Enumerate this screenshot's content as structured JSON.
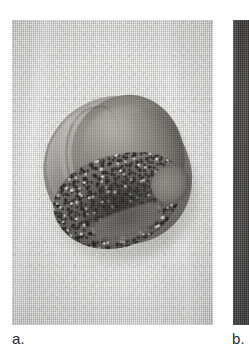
{
  "figure": {
    "type": "clinical-photograph-figure",
    "orientation": "two-panel-horizontal",
    "color_mode": "grayscale",
    "background_color": "#ffffff"
  },
  "panels": [
    {
      "id": "a",
      "caption": "a.",
      "kind": "photograph",
      "fully_visible": true,
      "subject": "amputated digit tip specimen with nail plate and dark crusted ulcerated lesion at the nail base",
      "background_surface": "light woven cloth drape",
      "colors": {
        "cloth_light": "#e9e8e4",
        "cloth_mid": "#d6d5d1",
        "cloth_dark": "#cbcac6",
        "specimen_light": "#b6b2ab",
        "specimen_mid": "#908c85",
        "specimen_dark": "#7c7872",
        "nail_plate": "#8d8880",
        "lesion_dark": "#474440",
        "lesion_core": "#262422",
        "crust_fleck": "#f0eee9"
      }
    },
    {
      "id": "b",
      "caption": "b.",
      "kind": "photograph",
      "fully_visible": false,
      "crop_note": "only the narrow left edge of the second photograph is visible at the right margin",
      "subject": "dark vertical strip of an adjacent photograph",
      "colors": {
        "strip_light": "#6d6a66",
        "strip_mid": "#514e4b",
        "strip_dark": "#454341"
      }
    }
  ],
  "captions": {
    "panel_a_label": "a.",
    "panel_b_label": "b."
  }
}
